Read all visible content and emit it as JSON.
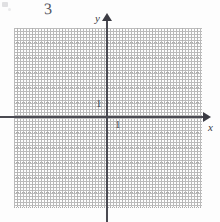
{
  "figure": {
    "kind": "cartesian-coordinate-grid",
    "problem_number": "3",
    "background_color": "#fdfdfd",
    "axis_color": "#4a4a52",
    "grid_color_minor": "#d2d2d2",
    "grid_color_major": "#adadad"
  },
  "axes": {
    "x": {
      "label": "x",
      "tick_labels": [
        "1"
      ],
      "arrow": "right-arrowhead"
    },
    "y": {
      "label": "y",
      "tick_labels": [
        "1"
      ],
      "arrow": "up-arrowhead"
    }
  },
  "grid": {
    "cell_size_px": 15,
    "columns": 13,
    "rows": 12,
    "dotted": true,
    "origin_px": {
      "x": 107,
      "y": 117
    }
  },
  "annotations": {
    "scan_artifact": "scan-speck"
  }
}
